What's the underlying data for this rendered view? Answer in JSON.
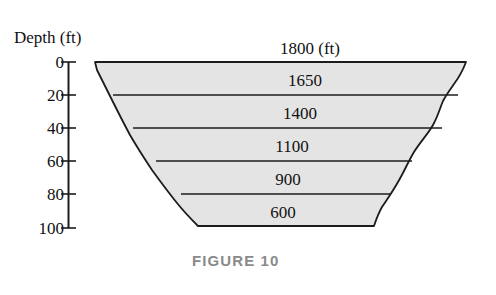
{
  "figure": {
    "caption": "FIGURE 10",
    "axis_title": "Depth (ft)",
    "depth_unit": "ft",
    "width_unit": "ft"
  },
  "axis": {
    "ticks": [
      {
        "label": "0",
        "value": 0
      },
      {
        "label": "20",
        "value": 20
      },
      {
        "label": "40",
        "value": 40
      },
      {
        "label": "60",
        "value": 60
      },
      {
        "label": "80",
        "value": 80
      },
      {
        "label": "100",
        "value": 100
      }
    ]
  },
  "bands": [
    {
      "label": "1800 (ft)",
      "width": 1800,
      "depth": 0
    },
    {
      "label": "1650",
      "width": 1650,
      "depth": 20
    },
    {
      "label": "1400",
      "width": 1400,
      "depth": 40
    },
    {
      "label": "1100",
      "width": 1100,
      "depth": 60
    },
    {
      "label": "900",
      "width": 900,
      "depth": 80
    },
    {
      "label": "600",
      "width": 600,
      "depth": 100
    }
  ],
  "colors": {
    "fill": "#e4e4e4",
    "outline": "#1c1c1c",
    "caption": "#8a8a8a",
    "text": "#111111",
    "background": "#ffffff"
  },
  "chart_data": {
    "type": "area",
    "title": "FIGURE 10",
    "xlabel": "Width (ft)",
    "ylabel": "Depth (ft)",
    "ylim": [
      0,
      100
    ],
    "y_ticks": [
      0,
      20,
      40,
      60,
      80,
      100
    ],
    "grid": false,
    "legend": null,
    "categories": [
      0,
      20,
      40,
      60,
      80,
      100
    ],
    "values": [
      1800,
      1650,
      1400,
      1100,
      900,
      600
    ],
    "series": [
      {
        "name": "Cross-sectional width",
        "x": [
          0,
          20,
          40,
          60,
          80,
          100
        ],
        "values": [
          1800,
          1650,
          1400,
          1100,
          900,
          600
        ]
      }
    ],
    "annotations": [
      {
        "text": "1800 (ft)",
        "depth": 0
      },
      {
        "text": "1650",
        "depth": 20
      },
      {
        "text": "1400",
        "depth": 40
      },
      {
        "text": "1100",
        "depth": 60
      },
      {
        "text": "900",
        "depth": 80
      },
      {
        "text": "600",
        "depth": 100
      }
    ]
  }
}
